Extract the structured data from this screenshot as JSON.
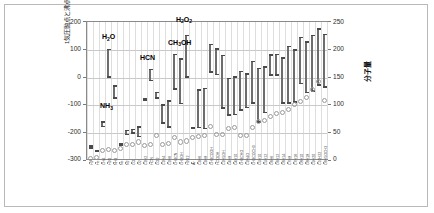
{
  "chart_data": {
    "type": "bar",
    "title": "",
    "subtitle": "",
    "xlabel": "",
    "ylabel": "1気圧融点と沸点(℃)",
    "ylabel_right": "分子量",
    "ylim": [
      -300,
      200
    ],
    "ylim_right": [
      0,
      250
    ],
    "yticks": [
      200,
      100,
      0,
      -100,
      -200,
      -300
    ],
    "yticks_right": [
      250,
      200,
      150,
      100,
      50,
      0
    ],
    "grid": true,
    "legend_position": "none",
    "series": [
      {
        "name": "melting-boiling-range",
        "type": "range-bar",
        "unit": "°C",
        "axis": "left"
      },
      {
        "name": "分子量",
        "type": "scatter",
        "marker": "open-circle",
        "axis": "right"
      }
    ],
    "annotations": [
      {
        "text": "H₂O",
        "html": "H<sub>2</sub>O",
        "x_index": 3,
        "value": 100
      },
      {
        "text": "NH₃",
        "html": "NH<sub>3</sub>",
        "x_index": 3,
        "value": -78
      },
      {
        "text": "HCN",
        "html": "HCN",
        "x_index": 10,
        "value": 26
      },
      {
        "text": "CH₃OH",
        "html": "CH<sub>3</sub>OH",
        "x_index": 15,
        "value": 65
      },
      {
        "text": "H₂O₂",
        "html": "H<sub>2</sub>O<sub>2</sub>",
        "x_index": 16,
        "value": 150
      }
    ],
    "categories": [
      "H2",
      "He",
      "CH4",
      "H2O",
      "NH3",
      "Ne",
      "N2",
      "CO",
      "O2",
      "C2H2",
      "HCN",
      "CO2",
      "C2H4",
      "C2H6",
      "CH3CN",
      "CH3OH",
      "H2O2",
      "Ar",
      "C3H6",
      "C3H8",
      "CH3COOH",
      "HCOOH",
      "C2H5OH",
      "C4H8",
      "C4H10",
      "CH3CHO",
      "C2H4O",
      "CH3COCH3",
      "C5H10",
      "C5H12",
      "C6H6",
      "C6H12",
      "C6H14",
      "C7H8",
      "C7H16",
      "C8H10",
      "C8H18",
      "C9H20",
      "C10H22",
      "C6H5OCH3"
    ],
    "melting_points": [
      -259,
      -272,
      -182,
      0,
      -78,
      -249,
      -210,
      -205,
      -218,
      -84,
      -14,
      -57,
      -169,
      -183,
      -45,
      -98,
      -1,
      -189,
      -185,
      -188,
      17,
      8,
      -114,
      -140,
      -138,
      -121,
      -112,
      -95,
      -165,
      -130,
      6,
      7,
      -95,
      -95,
      -91,
      -25,
      -57,
      -51,
      -30,
      -37
    ],
    "boiling_points": [
      -253,
      -269,
      -164,
      100,
      -33,
      -246,
      -196,
      -192,
      -183,
      -81,
      26,
      -78,
      -104,
      -89,
      82,
      65,
      150,
      -186,
      -48,
      -42,
      118,
      101,
      78,
      -6,
      -1,
      20,
      11,
      56,
      30,
      36,
      80,
      81,
      69,
      111,
      98,
      144,
      126,
      151,
      174,
      154
    ],
    "molecular_weights": [
      2,
      4,
      16,
      18,
      17,
      20,
      28,
      28,
      32,
      26,
      27,
      44,
      28,
      30,
      41,
      32,
      34,
      40,
      42,
      44,
      60,
      46,
      46,
      56,
      58,
      44,
      44,
      58,
      70,
      72,
      78,
      84,
      86,
      92,
      100,
      106,
      114,
      128,
      142,
      108
    ]
  },
  "axis": {
    "left_title": "1気圧融点と沸点(℃)",
    "right_title": "分子量",
    "left_ticks": [
      "200",
      "100",
      "0",
      "-100",
      "-200",
      "-300"
    ],
    "right_ticks": [
      "250",
      "200",
      "150",
      "100",
      "50",
      "0"
    ]
  }
}
